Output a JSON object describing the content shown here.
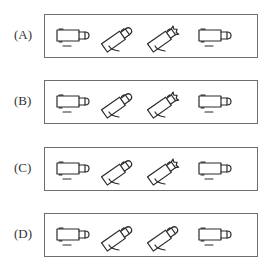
{
  "question": {
    "options": [
      {
        "label": "(A)",
        "figures": [
          {
            "icon": "camera-horizontal-icon",
            "orientation": "horizontal"
          },
          {
            "icon": "camera-tilted-icon",
            "orientation": "tilted-up-right",
            "lens_cap": "rounded"
          },
          {
            "icon": "camera-tilted-icon",
            "orientation": "tilted-up-right",
            "lens_cap": "notched"
          },
          {
            "icon": "camera-horizontal-icon",
            "orientation": "horizontal"
          }
        ]
      },
      {
        "label": "(B)",
        "figures": [
          {
            "icon": "camera-horizontal-icon",
            "orientation": "horizontal"
          },
          {
            "icon": "camera-tilted-icon",
            "orientation": "tilted-up-right",
            "lens_cap": "rounded"
          },
          {
            "icon": "camera-tilted-icon",
            "orientation": "tilted-up-right",
            "lens_cap": "notched"
          },
          {
            "icon": "camera-horizontal-icon",
            "orientation": "horizontal"
          }
        ]
      },
      {
        "label": "(C)",
        "figures": [
          {
            "icon": "camera-horizontal-icon",
            "orientation": "horizontal"
          },
          {
            "icon": "camera-tilted-icon",
            "orientation": "tilted-up-right",
            "lens_cap": "rounded"
          },
          {
            "icon": "camera-tilted-icon",
            "orientation": "tilted-up-right",
            "lens_cap": "notched"
          },
          {
            "icon": "camera-horizontal-icon",
            "orientation": "horizontal"
          }
        ]
      },
      {
        "label": "(D)",
        "figures": [
          {
            "icon": "camera-horizontal-icon",
            "orientation": "horizontal"
          },
          {
            "icon": "camera-tilted-icon",
            "orientation": "tilted-up-right",
            "lens_cap": "rounded"
          },
          {
            "icon": "camera-tilted-icon",
            "orientation": "tilted-up-right",
            "lens_cap": "rounded"
          },
          {
            "icon": "camera-horizontal-icon",
            "orientation": "horizontal"
          }
        ]
      }
    ]
  },
  "colors": {
    "line": "#2b2b2b",
    "box_border": "#6e6e6e",
    "background": "#ffffff"
  }
}
